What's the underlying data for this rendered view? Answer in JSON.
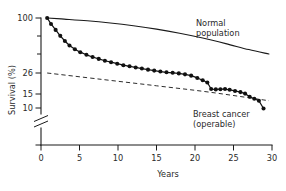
{
  "chart_data": {
    "type": "line",
    "title": "",
    "xlabel": "Years",
    "ylabel": "Survival (%)",
    "xlim": [
      0,
      30
    ],
    "xticks": [
      0,
      5,
      10,
      15,
      20,
      25,
      30
    ],
    "xticklabels": [
      "0",
      "5",
      "10",
      "15",
      "20",
      "25",
      "30"
    ],
    "yticks": [
      100,
      26,
      15,
      10,
      0
    ],
    "yticklabels": [
      "100",
      "26",
      "15",
      "10",
      "0"
    ],
    "y_axis_break": true,
    "y_axis_break_note": "axis broken between 10 and 0",
    "y_minor_ticks": [
      80,
      60,
      40
    ],
    "grid": false,
    "legend": "none",
    "annotations": [
      {
        "name": "normal-population-label",
        "line1": "Normal",
        "line2": "population",
        "x": 21.5,
        "y": 78
      },
      {
        "name": "breast-cancer-label",
        "line1": "Breast cancer",
        "line2": "(operable)",
        "x": 22.0,
        "y": 12.5
      }
    ],
    "series": [
      {
        "name": "Normal population",
        "style": "solid",
        "markers": false,
        "x": [
          0.8,
          3,
          6,
          9,
          12,
          15,
          18,
          21,
          24,
          27,
          29.6
        ],
        "values": [
          100,
          98.5,
          96.2,
          93.2,
          89.5,
          85.0,
          79.5,
          73.0,
          65.5,
          57.5,
          51.5
        ]
      },
      {
        "name": "Breast cancer (operable)",
        "style": "solid",
        "markers": true,
        "x": [
          0.8,
          1.3,
          1.9,
          2.5,
          3.1,
          3.7,
          4.4,
          5.1,
          5.9,
          6.7,
          7.5,
          8.3,
          9.1,
          9.9,
          10.7,
          11.5,
          12.3,
          13.1,
          13.9,
          14.7,
          15.5,
          16.3,
          17.1,
          17.9,
          18.7,
          19.5,
          20.3,
          21.0,
          21.6,
          22.1,
          22.7,
          23.3,
          23.9,
          24.5,
          25.2,
          25.9,
          26.5,
          27.1,
          27.7,
          28.3,
          28.9
        ],
        "values": [
          100,
          92.0,
          84.0,
          76.0,
          69.0,
          63.0,
          58.0,
          54.0,
          50.5,
          47.5,
          45.0,
          42.5,
          40.5,
          38.5,
          36.5,
          35.0,
          33.5,
          32.0,
          30.5,
          29.2,
          28.0,
          27.0,
          26.3,
          25.8,
          25.3,
          24.6,
          23.4,
          22.2,
          21.0,
          17.6,
          17.4,
          17.5,
          17.6,
          17.2,
          16.6,
          16.0,
          15.2,
          14.0,
          13.3,
          12.6,
          9.6
        ]
      },
      {
        "name": "Reference trend (dashed)",
        "style": "dashed",
        "markers": false,
        "x": [
          0.8,
          8,
          15,
          22,
          29.6
        ],
        "values": [
          26,
          22.6,
          19.3,
          15.9,
          12.6
        ]
      }
    ]
  },
  "plot": {
    "left_px": 41,
    "right_px": 272,
    "top_px": 18,
    "bottom_px": 145,
    "axis_break_top_px": 114,
    "axis_break_bottom_px": 128
  }
}
